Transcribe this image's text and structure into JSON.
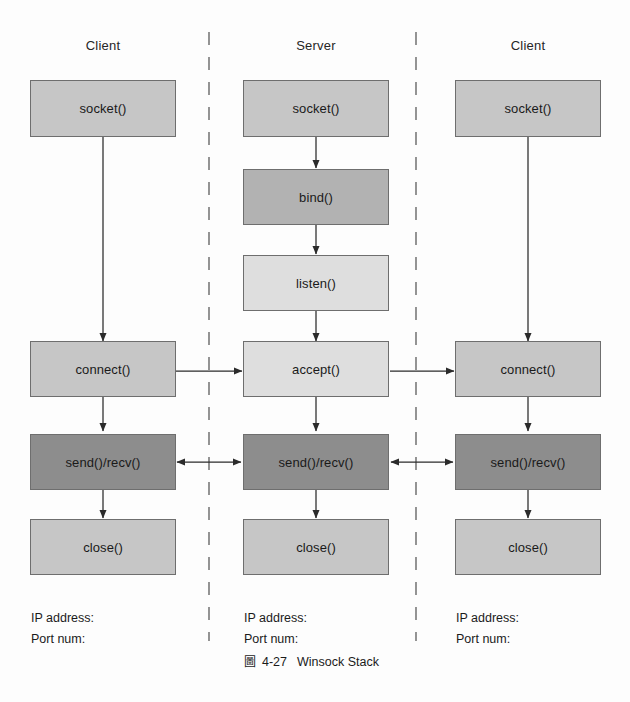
{
  "figure": {
    "caption_mark": "圖",
    "caption_number": "4-27",
    "caption_title": "Winsock Stack"
  },
  "colors": {
    "shade_mid": "#c6c6c6",
    "shade_dark": "#b2b2b2",
    "shade_light": "#dedede",
    "shade_deep": "#8d8d8d",
    "stroke": "#6e6e6e",
    "arrow": "#2b2b2b",
    "divider": "#8f8f8f",
    "background": "#fdfdfd"
  },
  "columns": [
    {
      "id": "client-left",
      "title": "Client",
      "nodes": [
        {
          "id": "socket",
          "label": "socket()",
          "shade": "shade-mid"
        },
        {
          "id": "connect",
          "label": "connect()",
          "shade": "shade-mid"
        },
        {
          "id": "sendrecv",
          "label": "send()/recv()",
          "shade": "shade-deep"
        },
        {
          "id": "close",
          "label": "close()",
          "shade": "shade-mid"
        }
      ],
      "endpoint": {
        "ip_label": "IP address:",
        "port_label": "Port num:"
      }
    },
    {
      "id": "server",
      "title": "Server",
      "nodes": [
        {
          "id": "socket",
          "label": "socket()",
          "shade": "shade-mid"
        },
        {
          "id": "bind",
          "label": "bind()",
          "shade": "shade-dark"
        },
        {
          "id": "listen",
          "label": "listen()",
          "shade": "shade-light"
        },
        {
          "id": "accept",
          "label": "accept()",
          "shade": "shade-light"
        },
        {
          "id": "sendrecv",
          "label": "send()/recv()",
          "shade": "shade-deep"
        },
        {
          "id": "close",
          "label": "close()",
          "shade": "shade-mid"
        }
      ],
      "endpoint": {
        "ip_label": "IP address:",
        "port_label": "Port num:"
      }
    },
    {
      "id": "client-right",
      "title": "Client",
      "nodes": [
        {
          "id": "socket",
          "label": "socket()",
          "shade": "shade-mid"
        },
        {
          "id": "connect",
          "label": "connect()",
          "shade": "shade-mid"
        },
        {
          "id": "sendrecv",
          "label": "send()/recv()",
          "shade": "shade-deep"
        },
        {
          "id": "close",
          "label": "close()",
          "shade": "shade-mid"
        }
      ],
      "endpoint": {
        "ip_label": "IP address:",
        "port_label": "Port num:"
      }
    }
  ],
  "connections": [
    {
      "id": "left-socket-to-connect",
      "kind": "vertical-arrow"
    },
    {
      "id": "left-connect-to-sendrecv",
      "kind": "vertical-arrow"
    },
    {
      "id": "left-sendrecv-to-close",
      "kind": "vertical-arrow"
    },
    {
      "id": "server-socket-to-bind",
      "kind": "vertical-arrow"
    },
    {
      "id": "server-bind-to-listen",
      "kind": "vertical-arrow"
    },
    {
      "id": "server-listen-to-accept",
      "kind": "vertical-arrow"
    },
    {
      "id": "server-accept-to-sendrecv",
      "kind": "vertical-arrow"
    },
    {
      "id": "server-sendrecv-to-close",
      "kind": "vertical-arrow"
    },
    {
      "id": "right-socket-to-connect",
      "kind": "vertical-arrow"
    },
    {
      "id": "right-connect-to-sendrecv",
      "kind": "vertical-arrow"
    },
    {
      "id": "right-sendrecv-to-close",
      "kind": "vertical-arrow"
    },
    {
      "id": "left-connect-to-server-accept",
      "kind": "arrow-right"
    },
    {
      "id": "server-accept-to-right-connect",
      "kind": "arrow-right"
    },
    {
      "id": "left-sendrecv-to-server-sendrecv",
      "kind": "arrow-both"
    },
    {
      "id": "server-sendrecv-to-right-sendrecv",
      "kind": "arrow-both"
    }
  ],
  "dividers": [
    {
      "id": "divider-left",
      "kind": "dashed-vertical"
    },
    {
      "id": "divider-right",
      "kind": "dashed-vertical"
    }
  ]
}
